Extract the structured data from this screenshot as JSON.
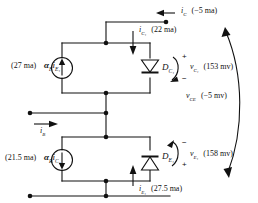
{
  "figure": {
    "type": "circuit-diagram"
  },
  "labels": {
    "ic_current": "i",
    "ic_sub": "C",
    "ic_value": "(−5 ma)",
    "ic1_current": "i",
    "ic1_sub": "C₁",
    "ic1_value": "(22 ma)",
    "src_top_value": "(27 ma)",
    "src_top_expr_alpha": "α",
    "src_top_expr_alpha_sub": "F",
    "src_top_expr_i": "i",
    "src_top_expr_i_sub": "E₁",
    "diode_top": "D",
    "diode_top_sub": "C₁",
    "vc1": "v",
    "vc1_sub": "C₁",
    "vc1_value": "(153 mv)",
    "vc1_plus": "+",
    "vc1_minus": "−",
    "ib_current": "i",
    "ib_sub": "B",
    "src_bot_value": "(21.5 ma)",
    "src_bot_expr_alpha": "α",
    "src_bot_expr_alpha_sub": "R",
    "src_bot_expr_i": "i",
    "src_bot_expr_i_sub": "C₁",
    "diode_bot": "D",
    "diode_bot_sub": "E₁",
    "ve1": "v",
    "ve1_sub": "E₁",
    "ve1_value": "(158 mv)",
    "ve1_plus": "+",
    "ve1_minus": "−",
    "ie1_current": "i",
    "ie1_sub": "E₁",
    "ie1_value": "(27.5 ma)",
    "vce": "v",
    "vce_sub": "CE",
    "vce_value": "(−5 mv)"
  },
  "colors": {
    "line": "#111111",
    "background": "#ffffff",
    "text": "#111111"
  }
}
